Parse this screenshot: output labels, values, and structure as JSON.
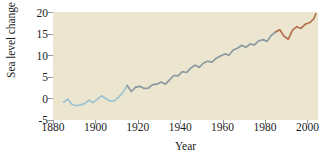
{
  "chart_data": {
    "type": "line",
    "title": "",
    "xlabel": "Year",
    "ylabel": "Sea level change (cm)",
    "xlim": [
      1880,
      2005
    ],
    "ylim": [
      -5,
      20
    ],
    "xticks": [
      1880,
      1900,
      1920,
      1940,
      1960,
      1980,
      2000
    ],
    "yticks": [
      -5,
      0,
      5,
      10,
      15,
      20
    ],
    "grid": false,
    "legend": "none",
    "plot_background": "#ece5cf",
    "series": [
      {
        "name": "Sea level change (early record)",
        "color": "#9cc3d4",
        "x": [
          1885,
          1887,
          1889,
          1891,
          1893,
          1895,
          1897,
          1899,
          1901,
          1903,
          1905,
          1907,
          1909,
          1911,
          1913,
          1915
        ],
        "values": [
          -0.9,
          -0.2,
          -1.4,
          -1.7,
          -1.5,
          -1.2,
          -0.4,
          -1.0,
          -0.1,
          0.6,
          -0.1,
          -0.6,
          -0.5,
          0.3,
          1.4,
          3.0
        ]
      },
      {
        "name": "Sea level change (mid record)",
        "color": "#8a9aa0",
        "x": [
          1915,
          1917,
          1919,
          1921,
          1923,
          1925,
          1927,
          1929,
          1931,
          1933,
          1935,
          1937,
          1939,
          1941,
          1943,
          1945,
          1947,
          1949,
          1951,
          1953,
          1955,
          1957,
          1959,
          1961,
          1963,
          1965,
          1967,
          1969,
          1971,
          1973,
          1975,
          1977,
          1979,
          1981,
          1983,
          1985
        ],
        "values": [
          3.0,
          1.6,
          2.6,
          2.8,
          2.3,
          2.4,
          3.2,
          3.3,
          3.8,
          3.3,
          4.3,
          5.3,
          5.2,
          6.2,
          6.0,
          7.0,
          7.7,
          7.2,
          8.2,
          8.6,
          8.4,
          9.3,
          9.8,
          10.3,
          10.0,
          11.2,
          11.6,
          12.3,
          11.8,
          12.6,
          12.4,
          13.3,
          13.6,
          13.2,
          14.6,
          15.4
        ]
      },
      {
        "name": "Sea level change (recent record)",
        "color": "#b5724e",
        "x": [
          1985,
          1987,
          1989,
          1991,
          1993,
          1995,
          1997,
          1999,
          2001,
          2003,
          2004
        ],
        "values": [
          15.4,
          15.9,
          14.4,
          13.7,
          15.8,
          16.6,
          16.2,
          17.2,
          17.5,
          18.4,
          19.6
        ]
      }
    ]
  }
}
